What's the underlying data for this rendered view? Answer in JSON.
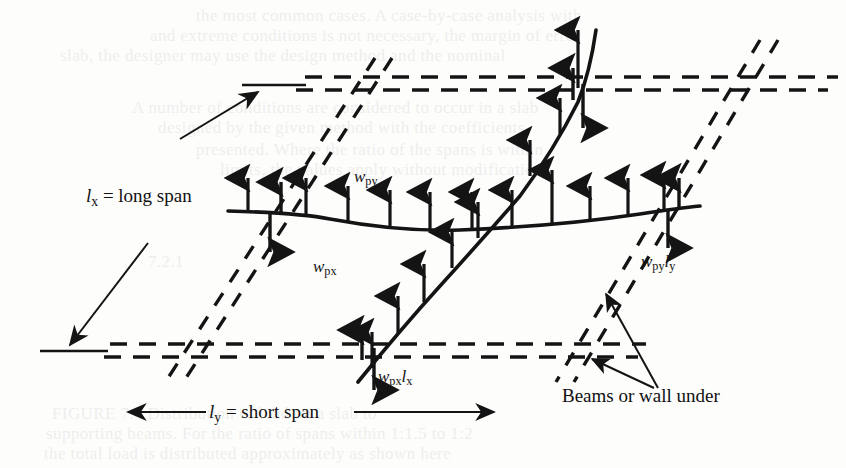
{
  "figure": {
    "background_color": "#fdfdfc",
    "ink_color": "#141414",
    "labels": {
      "long_span": {
        "symbol": "l",
        "subscript": "x",
        "text": "= long span"
      },
      "short_span": {
        "symbol": "l",
        "subscript": "y",
        "text": "= short span"
      },
      "load_wpy": {
        "symbol": "w",
        "subscript": "py"
      },
      "load_wpx": {
        "symbol": "w",
        "subscript": "px"
      },
      "reaction_wpxlx": {
        "symbol": "w",
        "subscript": "px",
        "symbol2": "l",
        "subscript2": "x"
      },
      "reaction_wpyly": {
        "symbol": "w",
        "subscript": "py",
        "symbol2": "l",
        "subscript2": "y"
      },
      "beams_note": "Beams or wall under"
    },
    "dimension_lines": [
      {
        "name": "long-span-dimension",
        "orientation": "diagonal",
        "label": "l_x = long span"
      },
      {
        "name": "short-span-dimension",
        "orientation": "horizontal",
        "label": "l_y = short span"
      }
    ],
    "elements": [
      "slab-outline-parallelogram",
      "deflected-shape-long-direction",
      "deflected-shape-short-direction",
      "distributed-load-arrows",
      "support-reaction-arrows",
      "beam-leader-lines"
    ]
  },
  "ghost_text": {
    "lines": [
      {
        "text": "the most common cases. A case-by-case analysis with",
        "x": 196,
        "y": 6
      },
      {
        "text": "and extreme conditions is not necessary, the margin of error",
        "x": 150,
        "y": 26
      },
      {
        "text": "slab, the designer may use the design method and the nominal",
        "x": 60,
        "y": 46
      },
      {
        "text": "A number of conditions are considered to occur in a slab",
        "x": 132,
        "y": 98
      },
      {
        "text": "designed by the given method with the coefficients",
        "x": 158,
        "y": 118
      },
      {
        "text": "presented. Where the ratio of the spans is within",
        "x": 196,
        "y": 140
      },
      {
        "text": "limits, the values apply without modification",
        "x": 220,
        "y": 160
      },
      {
        "text": "7.2.1",
        "x": 148,
        "y": 252
      },
      {
        "text": "FIGURE 7.4  Distribution of load on a slab to",
        "x": 52,
        "y": 404
      },
      {
        "text": "supporting beams. For the ratio of spans within 1:1.5 to 1:2",
        "x": 46,
        "y": 424
      },
      {
        "text": "the total load is distributed approximately as shown here",
        "x": 44,
        "y": 444
      }
    ]
  }
}
